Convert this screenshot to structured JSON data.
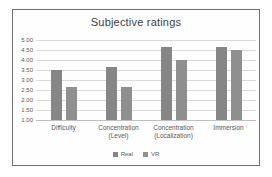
{
  "figure": {
    "title": "Subjective ratings"
  },
  "chart_data": {
    "type": "bar",
    "title": "Subjective ratings",
    "categories": [
      "Difficulty",
      "Concentration\n(Level)",
      "Concentration\n(Localization)",
      "Immersion"
    ],
    "series": [
      {
        "name": "Real",
        "color": "#868686",
        "values": [
          3.5,
          3.67,
          4.67,
          4.67
        ]
      },
      {
        "name": "VR",
        "color": "#8f8f8f",
        "values": [
          2.67,
          2.67,
          4.0,
          4.5
        ]
      }
    ],
    "ylabel": "",
    "xlabel": "",
    "ylim": [
      1.0,
      5.0
    ],
    "ytick_step": 0.5,
    "ytick_labels": [
      "5.00",
      "4.50",
      "4.00",
      "3.50",
      "3.00",
      "2.50",
      "2.00",
      "1.50",
      "1.00"
    ],
    "grid": true,
    "legend_position": "bottom",
    "colors": {
      "frame_border": "#6f6f6f",
      "gridline": "#d9d9d9",
      "axis_line": "#bfbfbf",
      "tick_text": "#595959",
      "title_text": "#404040",
      "background": "#fefefe"
    }
  }
}
